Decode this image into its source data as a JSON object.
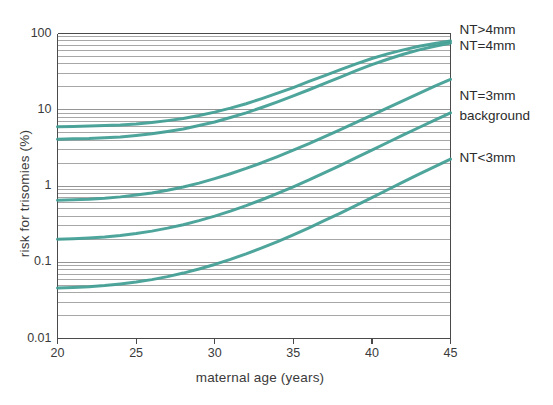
{
  "chart_data": {
    "type": "line",
    "title": "",
    "xlabel": "maternal age  (years)",
    "ylabel": "risk for trisomies  (%)",
    "xlim": [
      20,
      45
    ],
    "ylim": [
      0.01,
      100
    ],
    "yscale": "log",
    "xscale": "linear",
    "grid": true,
    "grid_axis": "y",
    "grid_minor": true,
    "legend_position": "right-inline",
    "line_color": "#3f9d92",
    "xticks": [
      20,
      25,
      30,
      35,
      40,
      45
    ],
    "xtick_labels": [
      "20",
      "25",
      "30",
      "35",
      "40",
      "45"
    ],
    "yticks": [
      0.01,
      0.1,
      1,
      10,
      100
    ],
    "ytick_labels": [
      "0.01",
      "0.1",
      "1",
      "10",
      "100"
    ],
    "x": [
      20,
      21,
      22,
      23,
      24,
      25,
      26,
      27,
      28,
      29,
      30,
      31,
      32,
      33,
      34,
      35,
      36,
      37,
      38,
      39,
      40,
      41,
      42,
      43,
      44,
      45
    ],
    "series": [
      {
        "name": "NT>4mm",
        "label": "NT>4mm",
        "values": [
          6.0,
          6.05,
          6.1,
          6.2,
          6.3,
          6.5,
          6.8,
          7.2,
          7.7,
          8.4,
          9.3,
          10.5,
          12.0,
          14.0,
          16.5,
          19.5,
          23.5,
          28.0,
          33.5,
          40.0,
          47.0,
          54.0,
          61.0,
          68.0,
          74.0,
          80.0
        ]
      },
      {
        "name": "NT=4mm",
        "label": "NT=4mm",
        "values": [
          4.1,
          4.15,
          4.2,
          4.3,
          4.4,
          4.6,
          4.85,
          5.2,
          5.6,
          6.2,
          6.9,
          7.9,
          9.1,
          10.7,
          12.7,
          15.2,
          18.3,
          22.2,
          26.8,
          32.5,
          39.0,
          46.0,
          53.5,
          61.0,
          68.0,
          75.0
        ]
      },
      {
        "name": "NT=3mm",
        "label": "NT=3mm",
        "values": [
          0.65,
          0.66,
          0.67,
          0.69,
          0.72,
          0.76,
          0.81,
          0.88,
          0.97,
          1.09,
          1.25,
          1.45,
          1.7,
          2.02,
          2.43,
          2.95,
          3.6,
          4.45,
          5.5,
          6.85,
          8.5,
          10.6,
          13.2,
          16.4,
          20.4,
          25.0
        ]
      },
      {
        "name": "background",
        "label": "background",
        "values": [
          0.2,
          0.203,
          0.208,
          0.215,
          0.225,
          0.238,
          0.256,
          0.28,
          0.311,
          0.351,
          0.402,
          0.468,
          0.552,
          0.66,
          0.798,
          0.975,
          1.2,
          1.5,
          1.87,
          2.35,
          2.96,
          3.72,
          4.68,
          5.85,
          7.3,
          9.1
        ]
      },
      {
        "name": "NT<3mm",
        "label": "NT<3mm",
        "values": [
          0.046,
          0.0467,
          0.0478,
          0.0495,
          0.0519,
          0.055,
          0.0592,
          0.0648,
          0.0721,
          0.0815,
          0.0936,
          0.1092,
          0.129,
          0.1545,
          0.187,
          0.229,
          0.283,
          0.353,
          0.442,
          0.557,
          0.705,
          0.893,
          1.132,
          1.43,
          1.8,
          2.25
        ]
      }
    ]
  },
  "legend": {
    "items": [
      {
        "label": "NT>4mm"
      },
      {
        "label": "NT=4mm"
      },
      {
        "label": "NT=3mm"
      },
      {
        "label": "background"
      },
      {
        "label": "NT<3mm"
      }
    ]
  }
}
